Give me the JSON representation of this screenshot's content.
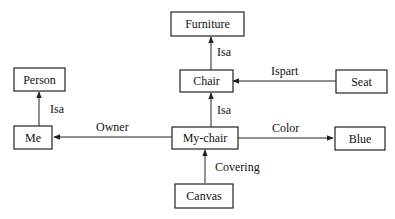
{
  "diagram": {
    "type": "semantic-network",
    "nodes": [
      {
        "id": "furniture",
        "label": "Furniture"
      },
      {
        "id": "person",
        "label": "Person"
      },
      {
        "id": "chair",
        "label": "Chair"
      },
      {
        "id": "seat",
        "label": "Seat"
      },
      {
        "id": "me",
        "label": "Me"
      },
      {
        "id": "my-chair",
        "label": "My-chair"
      },
      {
        "id": "blue",
        "label": "Blue"
      },
      {
        "id": "canvas",
        "label": "Canvas"
      }
    ],
    "edges": [
      {
        "from": "chair",
        "to": "furniture",
        "label": "Isa"
      },
      {
        "from": "seat",
        "to": "chair",
        "label": "Ispart"
      },
      {
        "from": "me",
        "to": "person",
        "label": "Isa"
      },
      {
        "from": "my-chair",
        "to": "chair",
        "label": "Isa"
      },
      {
        "from": "my-chair",
        "to": "me",
        "label": "Owner"
      },
      {
        "from": "my-chair",
        "to": "blue",
        "label": "Color"
      },
      {
        "from": "canvas",
        "to": "my-chair",
        "label": "Covering"
      }
    ]
  }
}
